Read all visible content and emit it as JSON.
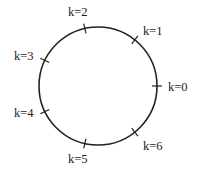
{
  "diagram": {
    "type": "circle-with-labeled-points",
    "circle": {
      "cx": 98,
      "cy": 86,
      "r": 59,
      "stroke": "#222222"
    },
    "points": [
      {
        "label": "k=0",
        "angle_deg": 0,
        "lx": 168,
        "ly": 91,
        "anchor": "start"
      },
      {
        "label": "k=1",
        "angle_deg": 51.4,
        "lx": 143,
        "ly": 35,
        "anchor": "start"
      },
      {
        "label": "k=2",
        "angle_deg": 102.9,
        "lx": 68,
        "ly": 16,
        "anchor": "start"
      },
      {
        "label": "k=3",
        "angle_deg": 154.3,
        "lx": 14,
        "ly": 60,
        "anchor": "start"
      },
      {
        "label": "k=4",
        "angle_deg": 205.7,
        "lx": 14,
        "ly": 117,
        "anchor": "start"
      },
      {
        "label": "k=5",
        "angle_deg": 257.1,
        "lx": 68,
        "ly": 163,
        "anchor": "start"
      },
      {
        "label": "k=6",
        "angle_deg": 308.6,
        "lx": 143,
        "ly": 150,
        "anchor": "start"
      }
    ]
  }
}
